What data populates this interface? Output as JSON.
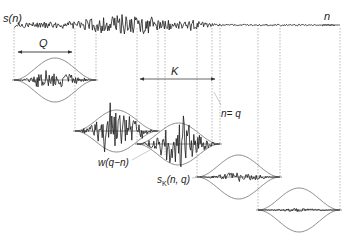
{
  "figure": {
    "type": "diagram",
    "colors": {
      "signal": "#1a1a1a",
      "envelope": "#6e6e6e",
      "guide": "#8a8a8a",
      "background": "#ffffff"
    },
    "labels": {
      "signal": "s(n)",
      "axis": "n",
      "window_length": "Q",
      "hop": "K",
      "position": "n= q",
      "window": "w(q−n)",
      "segment_prefix": "s",
      "segment_sub": "K",
      "segment_args": "(n, q)"
    },
    "signal_row": {
      "x0": 14,
      "x1": 335,
      "baseline_y": 25
    },
    "windows": [
      {
        "index": 1,
        "x0": 14,
        "x1": 96,
        "baseline_y": 80,
        "half_height": 22,
        "signal_amp": 0.35,
        "seed": 3
      },
      {
        "index": 2,
        "x0": 75,
        "x1": 158,
        "baseline_y": 131,
        "half_height": 21,
        "signal_amp": 0.9,
        "seed": 7
      },
      {
        "index": 3,
        "x0": 137,
        "x1": 220,
        "baseline_y": 144,
        "half_height": 21,
        "signal_amp": 1.0,
        "seed": 11
      },
      {
        "index": 4,
        "x0": 197,
        "x1": 280,
        "baseline_y": 177,
        "half_height": 22,
        "signal_amp": 0.22,
        "seed": 5
      },
      {
        "index": 5,
        "x0": 258,
        "x1": 340,
        "baseline_y": 210,
        "half_height": 22,
        "signal_amp": 0.08,
        "seed": 13
      }
    ],
    "arrows": {
      "Q": {
        "x0": 18,
        "x1": 72,
        "y": 52
      },
      "K": {
        "x0": 140,
        "x1": 215,
        "y": 79
      }
    }
  }
}
